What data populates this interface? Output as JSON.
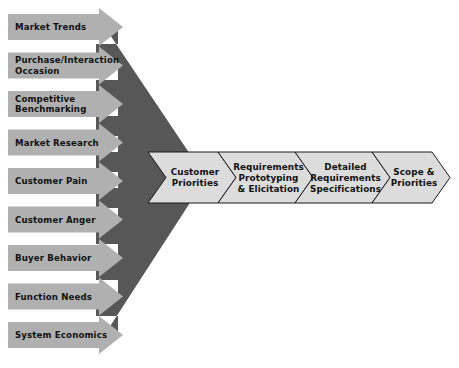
{
  "diagram": {
    "colors": {
      "background": "#ffffff",
      "input_bar_fill": "#b0b0b0",
      "funnel_fill": "#575757",
      "stage_fill": "#dcdcdc",
      "outline": "#1a1a1a",
      "text": "#111111"
    },
    "inputs": [
      {
        "id": "market-trends",
        "label": "Market Trends",
        "lines": [
          "Market Trends"
        ]
      },
      {
        "id": "purchase-interaction-occasion",
        "label": "Purchase/Interaction Occasion",
        "lines": [
          "Purchase/Interaction",
          "Occasion"
        ]
      },
      {
        "id": "competitive-benchmarking",
        "label": "Competitive Benchmarking",
        "lines": [
          "Competitive",
          "Benchmarking"
        ]
      },
      {
        "id": "market-research",
        "label": "Market Research",
        "lines": [
          "Market Research"
        ]
      },
      {
        "id": "customer-pain",
        "label": "Customer Pain",
        "lines": [
          "Customer Pain"
        ]
      },
      {
        "id": "customer-anger",
        "label": "Customer Anger",
        "lines": [
          "Customer Anger"
        ]
      },
      {
        "id": "buyer-behavior",
        "label": "Buyer Behavior",
        "lines": [
          "Buyer Behavior"
        ]
      },
      {
        "id": "function-needs",
        "label": "Function Needs",
        "lines": [
          "Function Needs"
        ]
      },
      {
        "id": "system-economics",
        "label": "System Economics",
        "lines": [
          "System Economics"
        ]
      }
    ],
    "stages": [
      {
        "id": "customer-priorities",
        "label": "Customer Priorities",
        "lines": [
          "Customer",
          "Priorities"
        ]
      },
      {
        "id": "requirements-prototyping-elicitation",
        "label": "Requirements Prototyping & Elicitation",
        "lines": [
          "Requirements",
          "Prototyping",
          "& Elicitation"
        ]
      },
      {
        "id": "detailed-requirements-specifications",
        "label": "Detailed Requirements Specifications",
        "lines": [
          "Detailed",
          "Requirements",
          "Specifications"
        ]
      },
      {
        "id": "scope-priorities",
        "label": "Scope & Priorities",
        "lines": [
          "Scope &",
          "Priorities"
        ]
      }
    ]
  }
}
